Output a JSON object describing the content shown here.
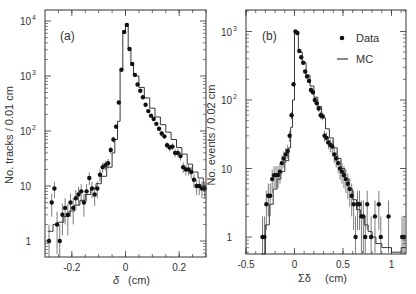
{
  "chart_data": [
    {
      "type": "line",
      "panel_label": "(a)",
      "title": "",
      "xlabel": "δ (cm)",
      "ylabel": "No. tracks / 0.01 cm",
      "yscale": "log",
      "xlim": [
        -0.3,
        0.3
      ],
      "ylim": [
        0.5,
        20000
      ],
      "x_ticks": [
        "-0.2",
        "0",
        "0.2"
      ],
      "y_ticks": [
        "1",
        "10",
        "10^2",
        "10^3",
        "10^4"
      ],
      "legend": [],
      "series": [
        {
          "name": "Data",
          "style": "points",
          "x": [
            -0.285,
            -0.275,
            -0.265,
            -0.255,
            -0.245,
            -0.235,
            -0.225,
            -0.215,
            -0.205,
            -0.195,
            -0.185,
            -0.175,
            -0.165,
            -0.155,
            -0.145,
            -0.135,
            -0.125,
            -0.115,
            -0.105,
            -0.095,
            -0.085,
            -0.075,
            -0.065,
            -0.055,
            -0.045,
            -0.035,
            -0.025,
            -0.015,
            -0.005,
            0.005,
            0.015,
            0.025,
            0.035,
            0.045,
            0.055,
            0.065,
            0.075,
            0.085,
            0.095,
            0.105,
            0.115,
            0.125,
            0.135,
            0.145,
            0.155,
            0.165,
            0.175,
            0.185,
            0.195,
            0.205,
            0.215,
            0.225,
            0.235,
            0.245,
            0.255,
            0.265,
            0.275,
            0.285,
            0.295
          ],
          "values": [
            1,
            5,
            9,
            2,
            1,
            3,
            4,
            3,
            5,
            4,
            6,
            7,
            8,
            5,
            8,
            14,
            9,
            7,
            9,
            16,
            22,
            24,
            26,
            45,
            70,
            120,
            330,
            1300,
            6300,
            8500,
            3100,
            1650,
            1050,
            700,
            540,
            410,
            300,
            230,
            190,
            165,
            135,
            110,
            90,
            80,
            55,
            50,
            52,
            40,
            40,
            35,
            22,
            20,
            20,
            18,
            13,
            10,
            10,
            9,
            9
          ],
          "color": "#111111"
        },
        {
          "name": "MC",
          "style": "step",
          "x": [
            -0.29,
            -0.27,
            -0.25,
            -0.23,
            -0.21,
            -0.19,
            -0.17,
            -0.15,
            -0.13,
            -0.11,
            -0.09,
            -0.07,
            -0.05,
            -0.04,
            -0.03,
            -0.02,
            -0.01,
            0.0,
            0.01,
            0.02,
            0.03,
            0.05,
            0.07,
            0.09,
            0.11,
            0.13,
            0.15,
            0.17,
            0.19,
            0.21,
            0.23,
            0.25,
            0.27,
            0.29
          ],
          "values": [
            1.5,
            2,
            2.2,
            2.8,
            3.5,
            4.5,
            5.5,
            7,
            9,
            11,
            15,
            22,
            40,
            70,
            150,
            1300,
            6500,
            8200,
            3000,
            1600,
            1000,
            620,
            400,
            260,
            180,
            130,
            95,
            70,
            50,
            38,
            25,
            18,
            14,
            10
          ],
          "color": "#111111"
        }
      ]
    },
    {
      "type": "line",
      "panel_label": "(b)",
      "title": "",
      "xlabel": "Σδ (cm)",
      "ylabel": "No. events / 0.02 cm",
      "yscale": "log",
      "xlim": [
        -0.5,
        1.15
      ],
      "ylim": [
        0.5,
        2000
      ],
      "x_ticks": [
        "-0.5",
        "0",
        "0.5",
        "1"
      ],
      "y_ticks": [
        "1",
        "10",
        "10^2",
        "10^3"
      ],
      "legend": [
        "Data",
        "MC"
      ],
      "legend_position": "upper right",
      "series": [
        {
          "name": "Data",
          "style": "points",
          "x": [
            -0.33,
            -0.31,
            -0.29,
            -0.27,
            -0.25,
            -0.23,
            -0.21,
            -0.19,
            -0.17,
            -0.15,
            -0.13,
            -0.11,
            -0.09,
            -0.07,
            -0.05,
            -0.03,
            -0.01,
            0.01,
            0.03,
            0.05,
            0.07,
            0.09,
            0.11,
            0.13,
            0.15,
            0.17,
            0.19,
            0.21,
            0.23,
            0.25,
            0.27,
            0.29,
            0.31,
            0.33,
            0.35,
            0.37,
            0.39,
            0.41,
            0.43,
            0.45,
            0.47,
            0.49,
            0.51,
            0.53,
            0.55,
            0.57,
            0.59,
            0.61,
            0.63,
            0.65,
            0.67,
            0.69,
            0.71,
            0.73,
            0.75,
            0.79,
            0.83,
            0.87,
            0.89,
            0.97,
            1.11,
            1.13
          ],
          "values": [
            1,
            1,
            3,
            4,
            4,
            7,
            8,
            8,
            8,
            9,
            12,
            14,
            16,
            18,
            30,
            60,
            170,
            1000,
            950,
            520,
            420,
            350,
            260,
            220,
            190,
            140,
            130,
            100,
            90,
            75,
            60,
            58,
            30,
            28,
            24,
            22,
            21,
            16,
            14,
            12,
            10,
            9,
            8,
            7,
            6,
            5,
            4,
            3,
            1,
            3,
            3,
            2,
            2,
            1,
            3,
            1,
            2,
            3,
            1,
            2,
            1,
            1
          ],
          "color": "#111111"
        },
        {
          "name": "MC",
          "style": "step",
          "x": [
            -0.34,
            -0.3,
            -0.26,
            -0.22,
            -0.18,
            -0.14,
            -0.1,
            -0.06,
            -0.04,
            -0.02,
            0.0,
            0.02,
            0.04,
            0.08,
            0.12,
            0.16,
            0.2,
            0.24,
            0.28,
            0.32,
            0.36,
            0.4,
            0.44,
            0.48,
            0.52,
            0.56,
            0.6,
            0.64,
            0.68,
            0.72,
            0.76,
            0.8,
            0.84,
            0.9,
            1.0,
            1.1
          ],
          "values": [
            0.5,
            1.5,
            3,
            5,
            7,
            9,
            13,
            20,
            40,
            100,
            950,
            900,
            500,
            350,
            230,
            160,
            110,
            80,
            55,
            38,
            28,
            20,
            14,
            10,
            7,
            5,
            3.5,
            2.5,
            2,
            1.5,
            1.2,
            1,
            0.8,
            0.7,
            0.6,
            0.7
          ],
          "color": "#111111"
        }
      ]
    }
  ],
  "panels": {
    "a": {
      "label": "(a)",
      "ylabel": "No. tracks / 0.01 cm",
      "xlabel_sym": "δ",
      "xlabel_unit": "(cm)",
      "xticks": [
        {
          "v": -0.2,
          "t": "-0.2"
        },
        {
          "v": 0,
          "t": "0"
        },
        {
          "v": 0.2,
          "t": "0.2"
        }
      ],
      "yticks": [
        {
          "e": 0,
          "t": "1",
          "sup": ""
        },
        {
          "e": 1,
          "t": "10",
          "sup": ""
        },
        {
          "e": 2,
          "t": "10",
          "sup": "2"
        },
        {
          "e": 3,
          "t": "10",
          "sup": "3"
        },
        {
          "e": 4,
          "t": "10",
          "sup": "4"
        }
      ]
    },
    "b": {
      "label": "(b)",
      "ylabel": "No. events / 0.02 cm",
      "xlabel_sym": "Σδ",
      "xlabel_unit": "(cm)",
      "legend_data": "Data",
      "legend_mc": "MC",
      "xticks": [
        {
          "v": -0.5,
          "t": "-0.5"
        },
        {
          "v": 0,
          "t": "0"
        },
        {
          "v": 0.5,
          "t": "0.5"
        },
        {
          "v": 1,
          "t": "1"
        }
      ],
      "yticks": [
        {
          "e": 0,
          "t": "1",
          "sup": ""
        },
        {
          "e": 1,
          "t": "10",
          "sup": ""
        },
        {
          "e": 2,
          "t": "10",
          "sup": "2"
        },
        {
          "e": 3,
          "t": "10",
          "sup": "3"
        }
      ]
    }
  }
}
